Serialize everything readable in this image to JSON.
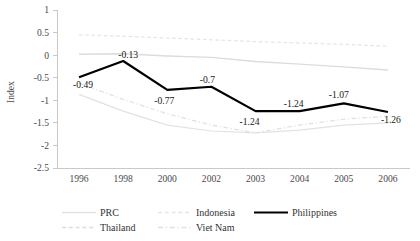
{
  "chart_data": {
    "type": "line",
    "title": "",
    "xlabel": "",
    "ylabel": "Index",
    "categories": [
      "1996",
      "1998",
      "2000",
      "2002",
      "2003",
      "2004",
      "2005",
      "2006"
    ],
    "ylim": [
      -2.5,
      1
    ],
    "yticks": [
      "1",
      "0.5",
      "0",
      "-0.5",
      "-1",
      "-1.5",
      "-2",
      "-2.5"
    ],
    "ytick_values": [
      1,
      0.5,
      0,
      -0.5,
      -1,
      -1.5,
      -2,
      -2.5
    ],
    "grid": false,
    "legend_position": "bottom",
    "series": [
      {
        "name": "PRC",
        "values": [
          -0.87,
          -1.24,
          -1.55,
          -1.68,
          -1.72,
          -1.66,
          -1.55,
          -1.5
        ],
        "color": "#e2e2e2",
        "style": "solid",
        "width": 1.2,
        "labels": []
      },
      {
        "name": "Thailand",
        "values": [
          0.02,
          0.03,
          -0.02,
          -0.05,
          -0.14,
          -0.2,
          -0.26,
          -0.33
        ],
        "color": "#dcdcdc",
        "style": "solid",
        "width": 1.4,
        "labels": []
      },
      {
        "name": "Indonesia",
        "values": [
          0.45,
          0.42,
          0.38,
          0.34,
          0.3,
          0.27,
          0.24,
          0.2
        ],
        "color": "#e5e5e5",
        "style": "dashed",
        "width": 1.2,
        "labels": []
      },
      {
        "name": "Viet Nam",
        "values": [
          -0.62,
          -0.98,
          -1.3,
          -1.55,
          -1.72,
          -1.55,
          -1.42,
          -1.35
        ],
        "color": "#e0e0e0",
        "style": "dashdot",
        "width": 1.2,
        "labels": []
      },
      {
        "name": "Philippines",
        "values": [
          -0.49,
          -0.13,
          -0.77,
          -0.7,
          -1.24,
          -1.24,
          -1.07,
          -1.26
        ],
        "color": "#000000",
        "style": "solid",
        "width": 2.2,
        "labels": [
          "-0.49",
          "-0.13",
          "-0.77",
          "-0.7",
          "-1.24",
          "-1.24",
          "-1.07",
          "-1.26"
        ]
      }
    ],
    "point_label_offsets": [
      {
        "dx": 4,
        "dy": 11
      },
      {
        "dx": 5,
        "dy": -3
      },
      {
        "dx": -3,
        "dy": 14
      },
      {
        "dx": -4,
        "dy": -4
      },
      {
        "dx": -6,
        "dy": 14
      },
      {
        "dx": -6,
        "dy": -4
      },
      {
        "dx": -5,
        "dy": -5
      },
      {
        "dx": 3,
        "dy": 11
      }
    ]
  },
  "legend": {
    "entries": [
      {
        "label": "PRC",
        "color": "#e2e2e2",
        "style": "solid"
      },
      {
        "label": "Thailand",
        "color": "#dcdcdc",
        "style": "dashed"
      },
      {
        "label": "Indonesia",
        "color": "#e5e5e5",
        "style": "dashed"
      },
      {
        "label": "Viet Nam",
        "color": "#e0e0e0",
        "style": "dashdot"
      },
      {
        "label": "Philippines",
        "color": "#000000",
        "style": "solid"
      }
    ],
    "columns": [
      {
        "x": 100,
        "entries": [
          0,
          1
        ]
      },
      {
        "x": 196,
        "entries": [
          2,
          3
        ]
      },
      {
        "x": 292,
        "entries": [
          4
        ]
      }
    ],
    "row_y": [
      216,
      231
    ]
  },
  "geometry": {
    "plot_left": 57,
    "plot_right": 410,
    "plot_top": 10,
    "plot_bottom": 168,
    "tick_label_y": 182,
    "axis_title_x": 14,
    "axis_title_y": 92
  }
}
